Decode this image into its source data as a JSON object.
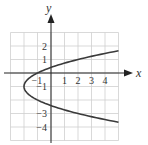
{
  "chart_data": {
    "type": "line",
    "title": "",
    "xlabel": "x",
    "ylabel": "y",
    "xlim": [
      -3,
      5
    ],
    "ylim": [
      -5,
      3
    ],
    "grid": true,
    "x_tick_labels": [
      "-1",
      "1",
      "2",
      "3",
      "4"
    ],
    "x_tick_values": [
      -1,
      1,
      2,
      3,
      4
    ],
    "y_tick_labels": [
      "2",
      "1",
      "-1",
      "-3",
      "-4"
    ],
    "y_tick_values": [
      2,
      1,
      -1,
      -3,
      -4
    ],
    "series": [
      {
        "name": "parabola (y+1)^2 = x+2",
        "equation": "x = (y+1)^2 - 2",
        "vertex": [
          -2,
          -1
        ],
        "points": [
          [
            4.98,
            1.65
          ],
          [
            4,
            1.45
          ],
          [
            3,
            1.24
          ],
          [
            2,
            1.0
          ],
          [
            1,
            0.73
          ],
          [
            0,
            0.41
          ],
          [
            -1,
            0
          ],
          [
            -1.75,
            -0.5
          ],
          [
            -2,
            -1
          ],
          [
            -1.75,
            -1.5
          ],
          [
            -1,
            -2
          ],
          [
            0,
            -2.41
          ],
          [
            1,
            -2.73
          ],
          [
            2,
            -3.0
          ],
          [
            3,
            -3.24
          ],
          [
            4,
            -3.45
          ],
          [
            4.98,
            -3.65
          ]
        ]
      }
    ],
    "colors": {
      "curve": "#3a3a3a",
      "axes": "#222222",
      "grid": "#cfcfcf"
    }
  }
}
